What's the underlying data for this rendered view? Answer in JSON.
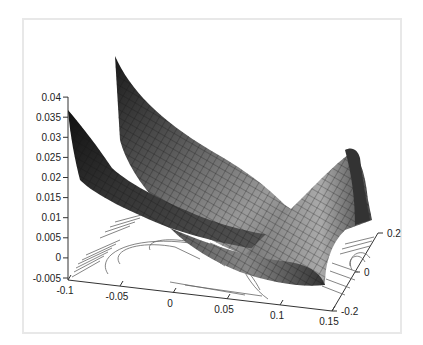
{
  "chart_data": {
    "type": "surface3d",
    "title": "",
    "xlabel": "",
    "ylabel": "",
    "zlabel": "",
    "x_ticks": [
      "-0.1",
      "-0.05",
      "0",
      "0.05",
      "0.1",
      "0.15"
    ],
    "y_ticks": [
      "-0.2",
      "0",
      "0.2"
    ],
    "z_ticks": [
      "-0.005",
      "0",
      "0.005",
      "0.01",
      "0.015",
      "0.02",
      "0.025",
      "0.03",
      "0.035",
      "0.04"
    ],
    "xlim": [
      -0.1,
      0.15
    ],
    "ylim": [
      -0.2,
      0.2
    ],
    "zlim": [
      -0.005,
      0.04
    ],
    "surface": {
      "description": "Saddle-like mesh surface with grayscale shading; two high ridges near x=-0.1 (peaks ~0.036 and ~0.04), dips to ~0 near center, rises toward x=0.15, y=0.2 (~0.02)",
      "colormap": "gray",
      "peak_front_left": 0.036,
      "peak_back_left": 0.04,
      "min_center": 0.0,
      "peak_right": 0.02
    },
    "contour": {
      "description": "Contour lines projected on the base plane at z=-0.005",
      "color": "#555555"
    },
    "grid": false,
    "legend": null
  },
  "colors": {
    "frame_border": "#e8e8e8",
    "axis": "#333333",
    "contour": "#666666"
  }
}
